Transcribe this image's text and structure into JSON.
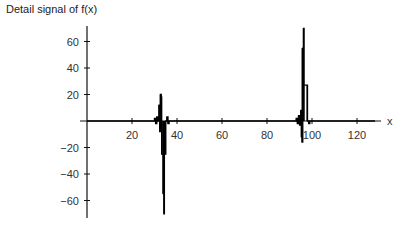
{
  "chart_data": {
    "type": "line",
    "title": "Detail signal of f(x)",
    "xlabel": "x",
    "ylabel": "",
    "xlim": [
      0,
      128
    ],
    "ylim": [
      -72,
      72
    ],
    "x_ticks": [
      20,
      40,
      60,
      80,
      100,
      120
    ],
    "y_ticks": [
      60,
      40,
      20,
      -20,
      -40,
      -60
    ],
    "grid": false,
    "legend": "none",
    "series": [
      {
        "name": "Detail signal",
        "color": "#000000",
        "points": [
          [
            0,
            0
          ],
          [
            29.5,
            0
          ],
          [
            30,
            2
          ],
          [
            30.5,
            -2
          ],
          [
            31,
            3
          ],
          [
            31.5,
            0
          ],
          [
            32,
            12
          ],
          [
            32.3,
            -8
          ],
          [
            32.6,
            20
          ],
          [
            33,
            18
          ],
          [
            33.2,
            -25
          ],
          [
            33.8,
            -25
          ],
          [
            34,
            -55
          ],
          [
            34.2,
            -70
          ],
          [
            34.4,
            -25
          ],
          [
            34.8,
            -25
          ],
          [
            35,
            0
          ],
          [
            35.5,
            3
          ],
          [
            36,
            -2
          ],
          [
            36.5,
            0
          ],
          [
            92,
            0
          ],
          [
            93,
            2
          ],
          [
            93.5,
            -2
          ],
          [
            94,
            4
          ],
          [
            94.5,
            -3
          ],
          [
            95,
            8
          ],
          [
            95.3,
            -12
          ],
          [
            95.6,
            -16
          ],
          [
            95.9,
            55
          ],
          [
            96.2,
            70
          ],
          [
            96.5,
            27
          ],
          [
            97.8,
            27
          ],
          [
            98,
            0
          ],
          [
            98.5,
            -2
          ],
          [
            99,
            0
          ],
          [
            128,
            0
          ]
        ]
      }
    ]
  }
}
